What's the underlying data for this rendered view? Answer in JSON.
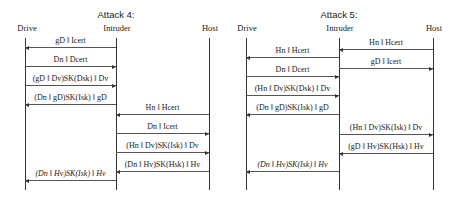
{
  "diagrams": [
    {
      "title": "Attack 4:",
      "title_x": 116,
      "actors": [
        {
          "name": "Drive",
          "x": 25,
          "label_x": 27
        },
        {
          "name": "Intruder",
          "x": 116,
          "label_x": 117
        },
        {
          "name": "Host",
          "x": 209,
          "label_x": 210
        }
      ],
      "lifeline_top": 38,
      "lifeline_bottom": 190,
      "messages": [
        {
          "label": "gD ‖ Icert",
          "from": 1,
          "to": 0,
          "y": 47,
          "italic": false
        },
        {
          "label": "Dn ‖ Dcert",
          "from": 0,
          "to": 1,
          "y": 66,
          "italic": false
        },
        {
          "label": "(gD ‖ Dv)SK(Dsk) ‖ Dv",
          "from": 0,
          "to": 1,
          "y": 85,
          "italic": false
        },
        {
          "label": "(Dn ‖ gD)SK(Isk) ‖ gD",
          "from": 1,
          "to": 0,
          "y": 104,
          "italic": false
        },
        {
          "label": "Hn ‖ Hcert",
          "from": 2,
          "to": 1,
          "y": 114,
          "italic": false
        },
        {
          "label": "Dn ‖ Icert",
          "from": 1,
          "to": 2,
          "y": 133,
          "italic": false
        },
        {
          "label": "(Hn ‖ Dv)SK(Isk) ‖ Dv",
          "from": 1,
          "to": 2,
          "y": 152,
          "italic": false
        },
        {
          "label": "(Dn ‖ Hv)SK(Hsk) ‖ Hv",
          "from": 2,
          "to": 1,
          "y": 171,
          "italic": false
        },
        {
          "label": "(Dn ‖ Hv)SK(Isk) ‖ Hv",
          "from": 1,
          "to": 0,
          "y": 180,
          "italic": true
        }
      ]
    },
    {
      "title": "Attack 5:",
      "title_x": 339,
      "actors": [
        {
          "name": "Drive",
          "x": 246,
          "label_x": 247
        },
        {
          "name": "Intruder",
          "x": 339,
          "label_x": 340
        },
        {
          "name": "Host",
          "x": 433,
          "label_x": 434
        }
      ],
      "lifeline_top": 38,
      "lifeline_bottom": 190,
      "messages": [
        {
          "label": "Hn ‖ Hcert",
          "from": 2,
          "to": 1,
          "y": 49,
          "italic": false
        },
        {
          "label": "Hn ‖ Hcert",
          "from": 1,
          "to": 0,
          "y": 57,
          "italic": false
        },
        {
          "label": "gD ‖ Icert",
          "from": 1,
          "to": 2,
          "y": 68,
          "italic": false
        },
        {
          "label": "Dn ‖ Dcert",
          "from": 0,
          "to": 1,
          "y": 76,
          "italic": false
        },
        {
          "label": "(Hn ‖ Dv)SK(Dsk) ‖ Dv",
          "from": 0,
          "to": 1,
          "y": 95,
          "italic": false
        },
        {
          "label": "(Dn ‖ gD)SK(Isk) ‖ gD",
          "from": 1,
          "to": 0,
          "y": 114,
          "italic": false
        },
        {
          "label": "(Hn ‖ Dv)SK(Isk) ‖ Dv",
          "from": 1,
          "to": 2,
          "y": 134,
          "italic": false
        },
        {
          "label": "(gD ‖ Hv)SK(Hsk) ‖ Hv",
          "from": 2,
          "to": 1,
          "y": 153,
          "italic": false
        },
        {
          "label": "(Dn ‖ Hv)SK(Isk) ‖ Hv",
          "from": 1,
          "to": 0,
          "y": 171,
          "italic": true
        }
      ]
    }
  ]
}
